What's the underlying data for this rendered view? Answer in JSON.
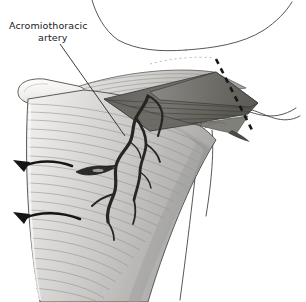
{
  "figure": {
    "background_color": "#ffffff",
    "width": 306,
    "height": 302
  },
  "labels": {
    "artery_label_line1": "Acromiothoracic",
    "artery_label_line2": "artery"
  },
  "annotations": {
    "leader_line_name": "leader-line-to-artery",
    "cut_line_name": "dashed-cut-line",
    "traction_arrow_upper": "upper-traction-arrow",
    "traction_arrow_lower": "lower-traction-arrow"
  },
  "structures": {
    "muscle_belly": "pectoralis-major-muscle",
    "cut_end": "cut-muscle-end",
    "deep_surface_flap": "reflected-muscle-deep-surface",
    "artery": "acromiothoracic-artery",
    "artery_branches": "arterial-branches",
    "shoulder_contour": "shoulder-and-arm-contour",
    "clavicle_contour": "clavicle-contour"
  },
  "colors": {
    "ink": "#1a1a1a",
    "muscle_light": "#f2f1ef",
    "muscle_mid": "#c9c8c6",
    "muscle_dark": "#9a9997",
    "flap_dark": "#6e6d6b",
    "flap_darker": "#565553",
    "outline": "#3a3a3a",
    "fiber_line": "#8d8c8a",
    "vessel": "#2b2b2b"
  }
}
